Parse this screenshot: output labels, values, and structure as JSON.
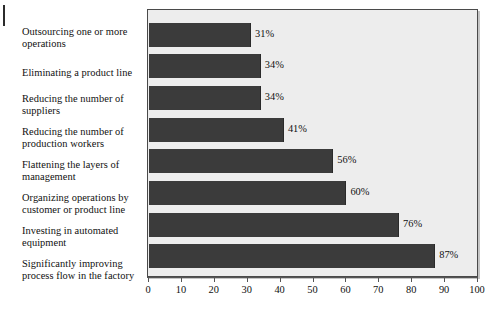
{
  "chart_data": {
    "type": "bar",
    "orientation": "horizontal",
    "title": "",
    "subtitle": "",
    "xlabel": "",
    "ylabel": "",
    "xlim": [
      0,
      100
    ],
    "xticks": [
      0,
      10,
      20,
      30,
      40,
      50,
      60,
      70,
      80,
      90,
      100
    ],
    "xtick_labels": [
      "0",
      "10",
      "20",
      "30",
      "40",
      "50",
      "60",
      "70",
      "80",
      "90",
      "100"
    ],
    "grid": false,
    "legend": null,
    "categories": [
      "Outsourcing one or more operations",
      "Eliminating a product line",
      "Reducing the number of suppliers",
      "Reducing the number of production workers",
      "Flattening the layers of management",
      "Organizing operations by customer or product line",
      "Investing in automated equipment",
      "Significantly improving process flow in the factory"
    ],
    "values": [
      31,
      34,
      34,
      41,
      56,
      60,
      76,
      87
    ],
    "value_labels": [
      "31%",
      "34%",
      "34%",
      "41%",
      "56%",
      "60%",
      "76%",
      "87%"
    ],
    "colors": {
      "bar": "#3b3b3b",
      "plot_background": "#ededed",
      "page_background": "#ffffff",
      "axis": "#555555",
      "text": "#101010",
      "plot_border": "#4a4a4a"
    }
  },
  "labels": {
    "cat0_line1": "Outsourcing one or more",
    "cat0_line2": "operations",
    "cat1_line1": "Eliminating a product line",
    "cat1_line2": "",
    "cat2_line1": "Reducing the number of",
    "cat2_line2": "suppliers",
    "cat3_line1": "Reducing the number of",
    "cat3_line2": "production workers",
    "cat4_line1": "Flattening the layers of",
    "cat4_line2": "management",
    "cat5_line1": "Organizing operations by",
    "cat5_line2": "customer or product line",
    "cat6_line1": "Investing in automated",
    "cat6_line2": "equipment",
    "cat7_line1": "Significantly improving",
    "cat7_line2": "process flow in the factory"
  }
}
